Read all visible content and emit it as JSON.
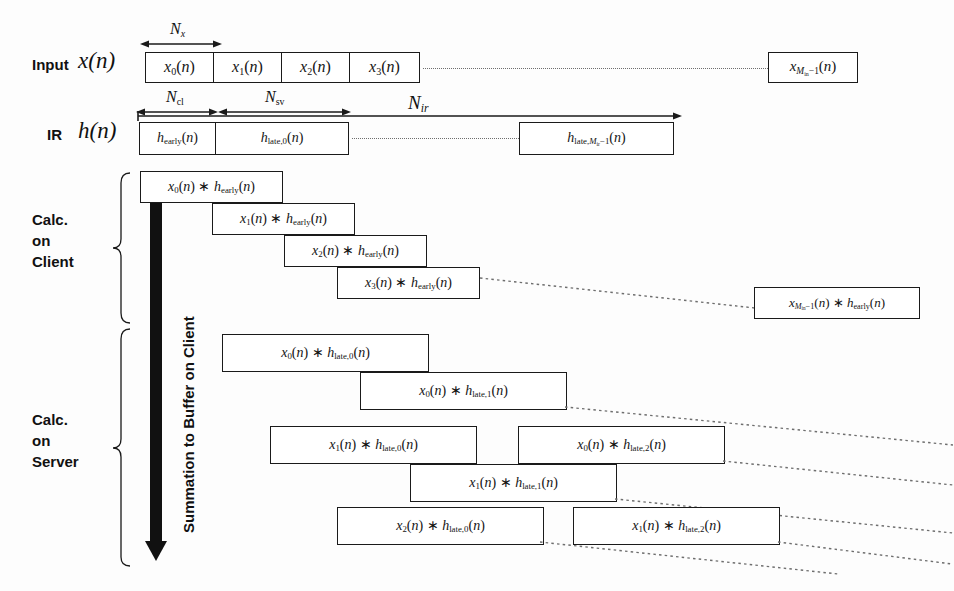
{
  "figure": {
    "kind": "signal-flow partitioned-convolution diagram",
    "row_labels": {
      "input_name": "Input",
      "input_signal": "x(n)",
      "ir_name": "IR",
      "ir_signal": "h(n)",
      "calc_client": [
        "Calc.",
        "on",
        "Client"
      ],
      "calc_server": [
        "Calc.",
        "on",
        "Server"
      ],
      "vertical_arrow": "Summation to Buffer on Client"
    },
    "dimension_labels": [
      {
        "name": "N_x",
        "base": "N",
        "sub": "x",
        "sub_italic": true
      },
      {
        "name": "N_cl",
        "base": "N",
        "sub": "cl",
        "sub_italic": false
      },
      {
        "name": "N_sv",
        "base": "N",
        "sub": "sv",
        "sub_italic": false
      },
      {
        "name": "N_ir",
        "base": "N",
        "sub": "ir",
        "sub_italic": true
      }
    ],
    "input_row": {
      "blocks": [
        "x_0(n)",
        "x_1(n)",
        "x_2(n)",
        "x_3(n)"
      ],
      "tail_block": "x_{M_in - 1}(n)",
      "ellipsis_is_dotted_line": true
    },
    "ir_row": {
      "blocks": [
        "h_early(n)",
        "h_late,0(n)"
      ],
      "tail_block": "h_late,M_ir - 1(n)",
      "ellipsis_is_dotted_line": true
    },
    "client_blocks": [
      "x_0(n) * h_early(n)",
      "x_1(n) * h_early(n)",
      "x_2(n) * h_early(n)",
      "x_3(n) * h_early(n)"
    ],
    "client_tail_block": "x_{M_in - 1}(n) * h_early(n)",
    "server_blocks": [
      "x_0(n) * h_late,0(n)",
      "x_0(n) * h_late,1(n)",
      "x_1(n) * h_late,0(n)",
      "x_0(n) * h_late,2(n)",
      "x_1(n) * h_late,1(n)",
      "x_2(n) * h_late,0(n)",
      "x_1(n) * h_late,2(n)"
    ],
    "colors": {
      "ink": "#1a1a1a",
      "paper": "#fdfdfd",
      "dotted": "#6e6e6e",
      "arrow_fill": "#111111"
    }
  }
}
